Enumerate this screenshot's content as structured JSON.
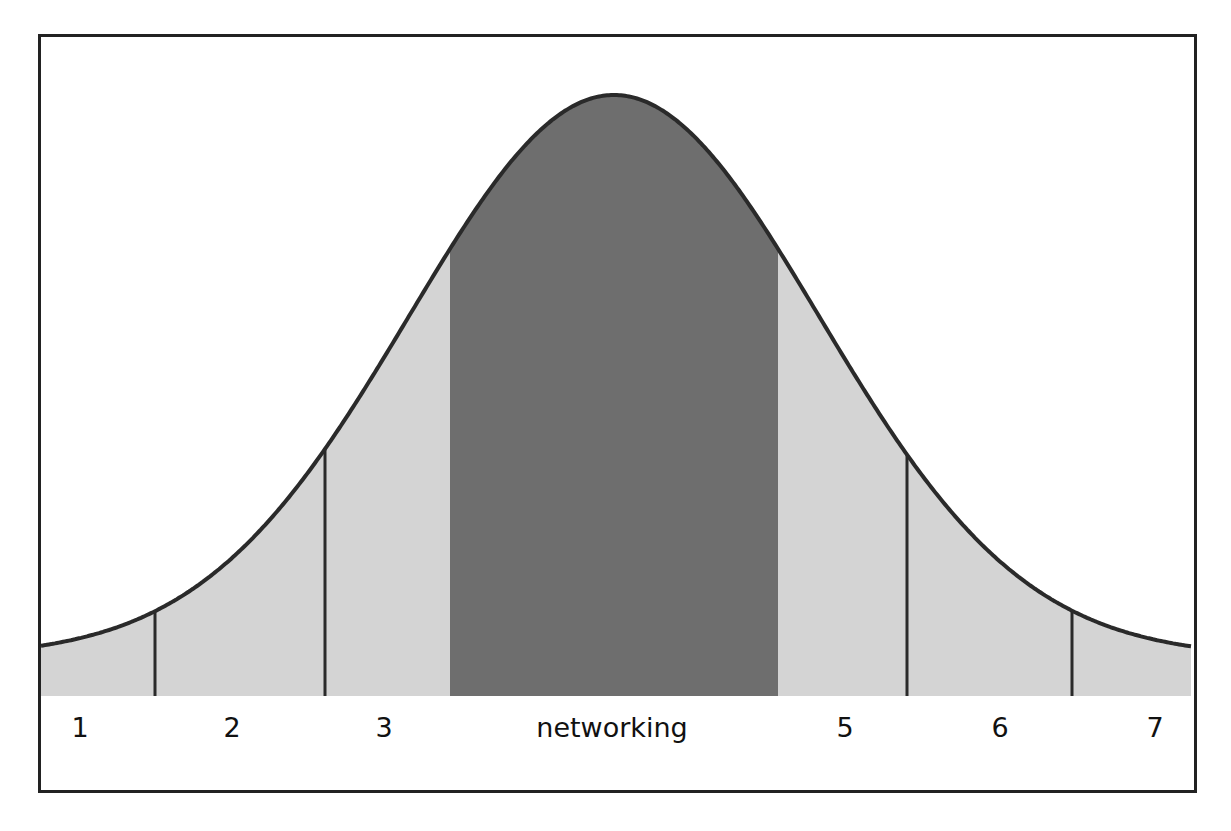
{
  "diagram": {
    "type": "bell-curve-segmented",
    "segments": [
      {
        "label": "1",
        "x_center": 80
      },
      {
        "label": "2",
        "x_center": 232
      },
      {
        "label": "3",
        "x_center": 384
      },
      {
        "label": "networking",
        "x_center": 612,
        "highlighted": true
      },
      {
        "label": "5",
        "x_center": 845
      },
      {
        "label": "6",
        "x_center": 1000
      },
      {
        "label": "7",
        "x_center": 1155
      }
    ],
    "dividers_x": [
      155,
      325,
      907,
      1072
    ],
    "highlight_band": {
      "x_start": 450,
      "x_end": 778
    },
    "colors": {
      "curve_stroke": "#2a2a2a",
      "fill_light": "#d4d4d4",
      "fill_highlight": "#6e6e6e",
      "border": "#222222",
      "background": "#ffffff"
    }
  }
}
